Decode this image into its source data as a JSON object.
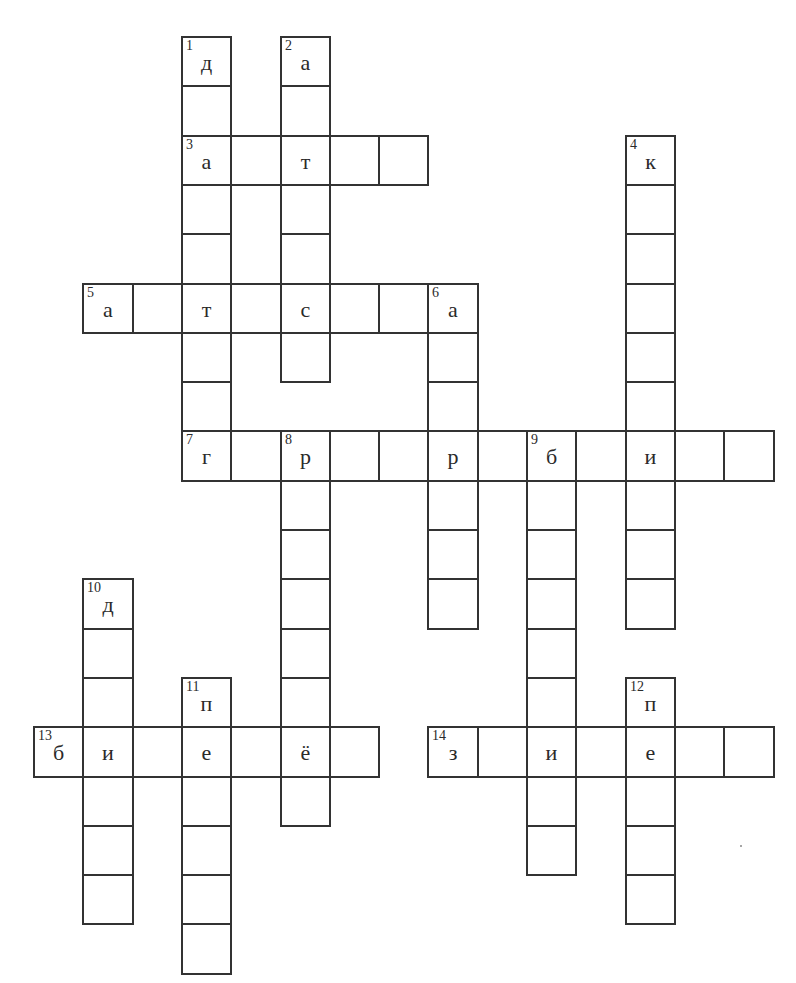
{
  "crossword": {
    "grid": {
      "origin_x": 33,
      "origin_y": 36,
      "cell_size": 49.3,
      "line_color": "#333333"
    },
    "words": [
      {
        "number": "1",
        "direction": "down",
        "col": 3,
        "row": 0,
        "length": 9,
        "given_letters": {
          "0": "д"
        }
      },
      {
        "number": "2",
        "direction": "down",
        "col": 5,
        "row": 0,
        "length": 7,
        "given_letters": {
          "0": "а"
        }
      },
      {
        "number": "3",
        "direction": "across",
        "col": 3,
        "row": 2,
        "length": 5,
        "given_letters": {
          "0": "а",
          "2": "т"
        }
      },
      {
        "number": "4",
        "direction": "down",
        "col": 12,
        "row": 2,
        "length": 10,
        "given_letters": {
          "0": "к"
        }
      },
      {
        "number": "5",
        "direction": "across",
        "col": 1,
        "row": 5,
        "length": 8,
        "given_letters": {
          "0": "а",
          "2": "т",
          "4": "с",
          "7": "а"
        }
      },
      {
        "number": "6",
        "direction": "down",
        "col": 8,
        "row": 5,
        "length": 7,
        "given_letters": {
          "0": "а"
        }
      },
      {
        "number": "7",
        "direction": "across",
        "col": 3,
        "row": 8,
        "length": 12,
        "given_letters": {
          "0": "г",
          "2": "р",
          "5": "р",
          "7": "б",
          "9": "и"
        }
      },
      {
        "number": "8",
        "direction": "down",
        "col": 5,
        "row": 8,
        "length": 8,
        "given_letters": {
          "0": "р"
        }
      },
      {
        "number": "9",
        "direction": "down",
        "col": 10,
        "row": 8,
        "length": 9,
        "given_letters": {
          "0": "б"
        }
      },
      {
        "number": "10",
        "direction": "down",
        "col": 1,
        "row": 11,
        "length": 7,
        "given_letters": {
          "0": "д"
        }
      },
      {
        "number": "11",
        "direction": "down",
        "col": 3,
        "row": 13,
        "length": 6,
        "given_letters": {
          "0": "п"
        }
      },
      {
        "number": "12",
        "direction": "down",
        "col": 12,
        "row": 13,
        "length": 5,
        "given_letters": {
          "0": "п"
        }
      },
      {
        "number": "13",
        "direction": "across",
        "col": 0,
        "row": 14,
        "length": 7,
        "given_letters": {
          "0": "б",
          "1": "и",
          "3": "е",
          "5": "ё"
        }
      },
      {
        "number": "14",
        "direction": "across",
        "col": 8,
        "row": 14,
        "length": 7,
        "given_letters": {
          "0": "з",
          "2": "и",
          "4": "е"
        }
      }
    ]
  }
}
